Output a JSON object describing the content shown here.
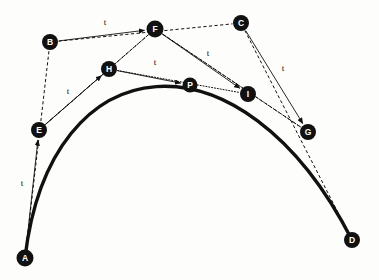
{
  "figure": {
    "background_color": "#fdfdfc",
    "ink_color": "#111111",
    "node_label_color": "#ffffff",
    "width": 379,
    "height": 280
  },
  "nodes": [
    {
      "id": "A",
      "label": "A",
      "x": 25,
      "y": 258,
      "r": 8.5,
      "level": "control"
    },
    {
      "id": "B",
      "label": "B",
      "x": 50,
      "y": 42,
      "r": 8.0,
      "level": "control"
    },
    {
      "id": "C",
      "label": "C",
      "x": 241,
      "y": 23,
      "r": 8.0,
      "level": "control"
    },
    {
      "id": "D",
      "label": "D",
      "x": 352,
      "y": 240,
      "r": 8.0,
      "level": "control"
    },
    {
      "id": "E",
      "label": "E",
      "x": 39,
      "y": 130,
      "r": 8.0,
      "level": "first"
    },
    {
      "id": "F",
      "label": "F",
      "x": 155,
      "y": 29,
      "r": 8.5,
      "level": "first"
    },
    {
      "id": "G",
      "label": "G",
      "x": 308,
      "y": 132,
      "r": 8.0,
      "level": "first"
    },
    {
      "id": "H",
      "label": "H",
      "x": 109,
      "y": 69,
      "r": 8.0,
      "level": "second"
    },
    {
      "id": "I",
      "label": "I",
      "x": 248,
      "y": 94,
      "r": 8.0,
      "level": "second"
    },
    {
      "id": "P",
      "label": "P",
      "x": 190,
      "y": 85,
      "r": 7.5,
      "level": "curve-point"
    }
  ],
  "dashed_edges": [
    {
      "name": "hull-a-b",
      "from": "A",
      "to": "B"
    },
    {
      "name": "hull-b-c",
      "from": "B",
      "to": "C"
    },
    {
      "name": "hull-c-d",
      "from": "C",
      "to": "D"
    },
    {
      "name": "hull-e-f",
      "from": "E",
      "to": "F"
    },
    {
      "name": "hull-f-g",
      "from": "F",
      "to": "G"
    }
  ],
  "dotted_edges": [
    {
      "name": "level2-e-f",
      "from": "E",
      "to": "F"
    },
    {
      "name": "level2-f-g",
      "from": "F",
      "to": "G"
    },
    {
      "name": "level3-h-i",
      "from": "H",
      "to": "I"
    }
  ],
  "arrow_edges": [
    {
      "name": "t-arrow-a-e",
      "from": "A",
      "to": "E",
      "label": "t",
      "label_x": 22,
      "label_y": 183
    },
    {
      "name": "t-arrow-b-f",
      "from": "B",
      "to": "F",
      "label": "t",
      "label_x": 105,
      "label_y": 22
    },
    {
      "name": "t-arrow-c-g",
      "from": "C",
      "to": "G",
      "label": "t",
      "label_x": 283,
      "label_y": 68
    },
    {
      "name": "t-arrow-e-h",
      "from": "E",
      "to": "H",
      "label": "t",
      "label_x": 68,
      "label_y": 91
    },
    {
      "name": "t-arrow-f-i",
      "from": "F",
      "to": "I",
      "label": "t",
      "label_x": 208,
      "label_y": 53
    },
    {
      "name": "t-arrow-h-p",
      "from": "H",
      "to": "P",
      "label": "t",
      "label_x": 155,
      "label_y": 62
    }
  ],
  "curve": {
    "name": "cubic-bezier-curve",
    "start": "A",
    "control1": "B",
    "control2": "C",
    "end": "D",
    "path": "M 25 258 C 50 42 241 23 352 240"
  },
  "labels": {
    "parameter": "t"
  }
}
